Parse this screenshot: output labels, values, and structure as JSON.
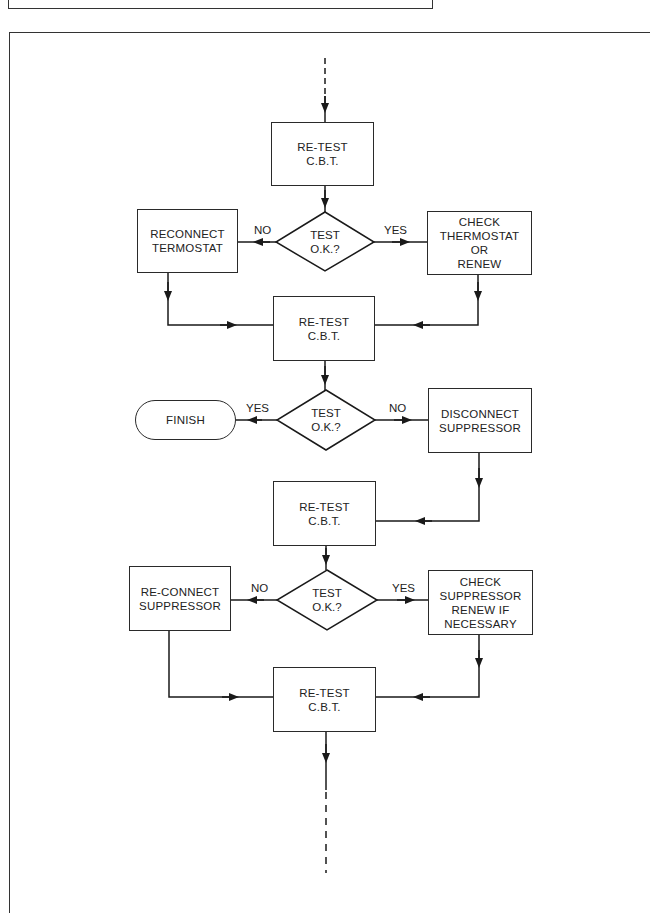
{
  "diagram": {
    "type": "flowchart",
    "nodes": {
      "retest1": {
        "lines": [
          "RE-TEST",
          "C.B.T."
        ]
      },
      "decision1": {
        "lines": [
          "TEST",
          "O.K.?"
        ]
      },
      "reconnect_thermostat": {
        "lines": [
          "RECONNECT",
          "TERMOSTAT"
        ]
      },
      "check_thermostat": {
        "lines": [
          "CHECK",
          "THERMOSTAT",
          "OR",
          "RENEW"
        ]
      },
      "retest2": {
        "lines": [
          "RE-TEST",
          "C.B.T."
        ]
      },
      "decision2": {
        "lines": [
          "TEST",
          "O.K.?"
        ]
      },
      "finish": {
        "lines": [
          "FINISH"
        ]
      },
      "disconnect_suppressor": {
        "lines": [
          "DISCONNECT",
          "SUPPRESSOR"
        ]
      },
      "retest3": {
        "lines": [
          "RE-TEST",
          "C.B.T."
        ]
      },
      "decision3": {
        "lines": [
          "TEST",
          "O.K.?"
        ]
      },
      "reconnect_suppressor": {
        "lines": [
          "RE-CONNECT",
          "SUPPRESSOR"
        ]
      },
      "check_suppressor": {
        "lines": [
          "CHECK",
          "SUPPRESSOR",
          "RENEW IF",
          "NECESSARY"
        ]
      },
      "retest4": {
        "lines": [
          "RE-TEST",
          "C.B.T."
        ]
      }
    },
    "edge_labels": {
      "d1_no": "NO",
      "d1_yes": "YES",
      "d2_yes": "YES",
      "d2_no": "NO",
      "d3_no": "NO",
      "d3_yes": "YES"
    },
    "edges": [
      {
        "from": "(continuation)",
        "to": "retest1"
      },
      {
        "from": "retest1",
        "to": "decision1"
      },
      {
        "from": "decision1",
        "to": "reconnect_thermostat",
        "label": "NO"
      },
      {
        "from": "decision1",
        "to": "check_thermostat",
        "label": "YES"
      },
      {
        "from": "reconnect_thermostat",
        "to": "retest2"
      },
      {
        "from": "check_thermostat",
        "to": "retest2"
      },
      {
        "from": "retest2",
        "to": "decision2"
      },
      {
        "from": "decision2",
        "to": "finish",
        "label": "YES"
      },
      {
        "from": "decision2",
        "to": "disconnect_suppressor",
        "label": "NO"
      },
      {
        "from": "disconnect_suppressor",
        "to": "retest3"
      },
      {
        "from": "retest3",
        "to": "decision3"
      },
      {
        "from": "decision3",
        "to": "reconnect_suppressor",
        "label": "NO"
      },
      {
        "from": "decision3",
        "to": "check_suppressor",
        "label": "YES"
      },
      {
        "from": "reconnect_suppressor",
        "to": "retest4"
      },
      {
        "from": "check_suppressor",
        "to": "retest4"
      },
      {
        "from": "retest4",
        "to": "(continuation)"
      }
    ]
  }
}
